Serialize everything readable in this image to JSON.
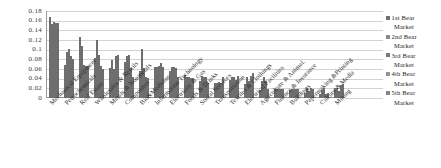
{
  "chart_data": {
    "type": "bar",
    "title": "",
    "subtitle": "",
    "xlabel": "",
    "ylabel": "",
    "ylim": [
      0,
      0.18
    ],
    "ytick_labels": [
      "0.18",
      "0.16",
      "0.14",
      "0.12",
      "0.1",
      "0.08",
      "0.06",
      "0.04",
      "0.02",
      "0"
    ],
    "ytick_values": [
      0.18,
      0.16,
      0.14,
      0.12,
      0.1,
      0.08,
      0.06,
      0.04,
      0.02,
      0
    ],
    "grid": true,
    "legend_position": "right",
    "categories": [
      "Mechanical Equipment",
      "Petrochemicals",
      "Real Estate",
      "Wholesales & Retails",
      "Metals & Nonmetals",
      "Composites",
      "Bio&Medicine",
      "Information Technology",
      "Electricity & Gas",
      "Foods & Drinks",
      "Social Services",
      "Transportation",
      "Textiles & Clothings",
      "Electrical Facilities",
      "Agriculture & Animal.",
      "Finance & Insurance",
      "Buildings",
      "Papermaking &Printing",
      "Culture & Media",
      "Mining"
    ],
    "series": [
      {
        "name": "1st Bear Market",
        "color": "#6f6f6f",
        "values": [
          0.168,
          0.069,
          0.127,
          0.082,
          0.062,
          0.074,
          0.056,
          0.065,
          0.056,
          0.047,
          0.035,
          0.031,
          0.037,
          0.03,
          0.017,
          0.019,
          0.017,
          0.01,
          0.009,
          0.02
        ]
      },
      {
        "name": "2nd Bear Market",
        "color": "#8a8a8a",
        "values": [
          0.153,
          0.096,
          0.108,
          0.12,
          0.079,
          0.086,
          0.101,
          0.064,
          0.064,
          0.043,
          0.046,
          0.031,
          0.043,
          0.044,
          0.035,
          0.018,
          0.019,
          0.02,
          0.016,
          0.021
        ]
      },
      {
        "name": "3rd Bear Market",
        "color": "#7a7a7a",
        "values": [
          0.157,
          0.101,
          0.068,
          0.088,
          0.06,
          0.088,
          0.062,
          0.066,
          0.064,
          0.043,
          0.043,
          0.033,
          0.044,
          0.036,
          0.044,
          0.019,
          0.019,
          0.014,
          0.02,
          0.014
        ]
      },
      {
        "name": "4th Bear Market",
        "color": "#959595",
        "values": [
          0.155,
          0.086,
          0.066,
          0.066,
          0.086,
          0.063,
          0.043,
          0.073,
          0.062,
          0.041,
          0.044,
          0.032,
          0.037,
          0.045,
          0.036,
          0.018,
          0.019,
          0.02,
          0.008,
          0.026
        ]
      },
      {
        "name": "5th Bear Market",
        "color": "#868686",
        "values": [
          0.156,
          0.081,
          0.067,
          0.06,
          0.088,
          0.044,
          0.042,
          0.065,
          0.043,
          0.041,
          0.032,
          0.043,
          0.045,
          0.052,
          0.018,
          0.019,
          0.019,
          0.019,
          0.01,
          0.029
        ]
      }
    ],
    "legend_entries": [
      {
        "line1": "1st Bear",
        "line2": "Market",
        "color": "#6f6f6f"
      },
      {
        "line1": "2nd Bear",
        "line2": "Market",
        "color": "#8a8a8a"
      },
      {
        "line1": "3rd Bear",
        "line2": "Market",
        "color": "#7a7a7a"
      },
      {
        "line1": "4th Bear",
        "line2": "Market",
        "color": "#959595"
      },
      {
        "line1": "5th Bear",
        "line2": "Market",
        "color": "#868686"
      }
    ]
  }
}
